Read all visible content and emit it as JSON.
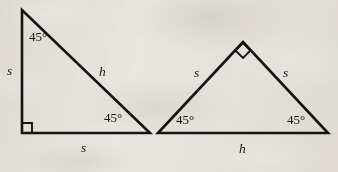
{
  "figure": {
    "kind": "geometry-diagram",
    "background_color": "#edebe7",
    "ink_color": "#141414"
  },
  "triangles": [
    {
      "id": "left-triangle",
      "name": "45-45-90 triangle with right angle at lower-left",
      "points": "22,10 22,133 150,133",
      "right_angle_marker": "M 22,124 L 31,124 L 31,133",
      "labels": {
        "angle_top": "45°",
        "angle_bottom_right": "45°",
        "leg_vertical": "s",
        "leg_horizontal": "s",
        "hypotenuse": "h"
      }
    },
    {
      "id": "right-triangle",
      "name": "45-45-90 triangle with right angle at apex",
      "points": "158,133 243,42 328,133",
      "right_angle_marker": "M 236,50 L 243,57 L 250,50 L 243,43 Z",
      "labels": {
        "angle_bottom_left": "45°",
        "angle_bottom_right": "45°",
        "leg_left": "s",
        "leg_right": "s",
        "hypotenuse": "h"
      }
    }
  ]
}
